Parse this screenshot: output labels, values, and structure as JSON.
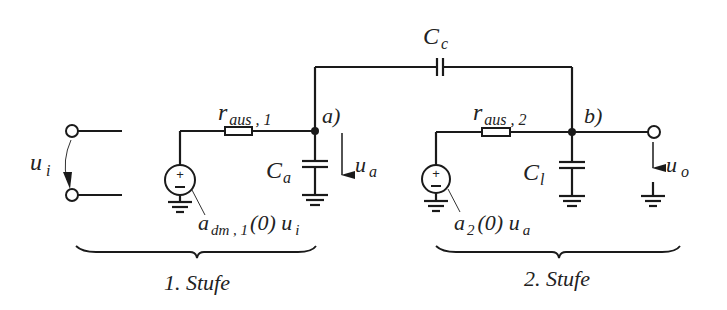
{
  "diagram": {
    "type": "circuit-schematic",
    "labels": {
      "coupling_cap": "C",
      "coupling_cap_sub": "c",
      "r1": "r",
      "r1_sub": "aus , 1",
      "r2": "r",
      "r2_sub": "aus , 2",
      "node_a": "a)",
      "node_b": "b)",
      "cap_a": "C",
      "cap_a_sub": "a",
      "cap_l": "C",
      "cap_l_sub": "l",
      "u_i": "u",
      "u_i_sub": "i",
      "u_a": "u",
      "u_a_sub": "a",
      "u_o": "u",
      "u_o_sub": "o",
      "src1_a": "a",
      "src1_sub": "dm , 1",
      "src1_rest": "(0) u",
      "src1_rest_sub": "i",
      "src2_a": "a",
      "src2_sub": "2",
      "src2_rest": "(0) u",
      "src2_rest_sub": "a",
      "stage1": "1. Stufe",
      "stage2": "2. Stufe"
    },
    "components": [
      {
        "id": "Cc",
        "kind": "capacitor",
        "between": [
          "a",
          "b"
        ]
      },
      {
        "id": "r_aus1",
        "kind": "resistor",
        "between": [
          "src1",
          "a"
        ]
      },
      {
        "id": "r_aus2",
        "kind": "resistor",
        "between": [
          "src2",
          "b"
        ]
      },
      {
        "id": "Ca",
        "kind": "capacitor",
        "between": [
          "a",
          "gnd"
        ]
      },
      {
        "id": "Cl",
        "kind": "capacitor",
        "between": [
          "b",
          "gnd"
        ]
      },
      {
        "id": "src1",
        "kind": "voltage-source",
        "value": "a_dm,1(0) u_i"
      },
      {
        "id": "src2",
        "kind": "voltage-source",
        "value": "a_2(0) u_a"
      }
    ],
    "colors": {
      "line": "#1a1a1a",
      "background": "#ffffff"
    }
  }
}
